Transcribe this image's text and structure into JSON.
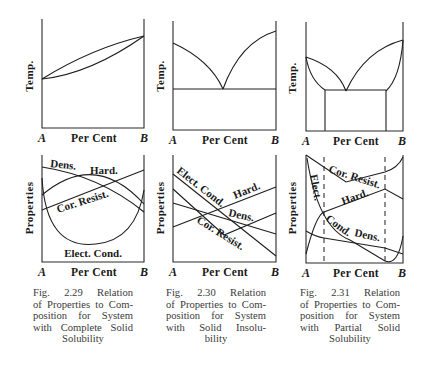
{
  "figures": [
    {
      "id": "2.29",
      "caption_lines": [
        "Fig. 2.29 Relation",
        "of Properties to Com-",
        "position for System",
        "with Complete Solid",
        "Solubility"
      ],
      "top_panel": {
        "ylabel": "Temp.",
        "xlabel": "Per Cent",
        "x_start": "A",
        "x_end": "B",
        "description": "Lens-shaped liquidus/solidus between melting points of A and B"
      },
      "bottom_panel": {
        "ylabel": "Properties",
        "xlabel": "Per Cent",
        "x_start": "A",
        "x_end": "B",
        "curve_labels": [
          "Dens.",
          "Hard.",
          "Cor. Resist.",
          "Elect. Cond."
        ]
      }
    },
    {
      "id": "2.30",
      "caption_lines": [
        "Fig. 2.30 Relation",
        "of Properties to Com-",
        "position for System",
        "with Solid Insolu-",
        "bility"
      ],
      "top_panel": {
        "ylabel": "Temp.",
        "xlabel": "Per Cent",
        "x_start": "A",
        "x_end": "B",
        "description": "Simple eutectic with horizontal eutectic line"
      },
      "bottom_panel": {
        "ylabel": "Properties",
        "xlabel": "Per Cent",
        "x_start": "A",
        "x_end": "B",
        "curve_labels": [
          "Elect. Cond.",
          "Hard.",
          "Dens.",
          "Cor. Resist."
        ]
      }
    },
    {
      "id": "2.31",
      "caption_lines": [
        "Fig. 2.31 Relation",
        "of Properties to Com-",
        "position for System",
        "with Partial Solid",
        "Solubility"
      ],
      "top_panel": {
        "ylabel": "Temp.",
        "xlabel": "Per Cent",
        "x_start": "A",
        "x_end": "B",
        "description": "Eutectic with terminal solid solutions and solvus lines"
      },
      "bottom_panel": {
        "ylabel": "Properties",
        "xlabel": "Per Cent",
        "x_start": "A",
        "x_end": "B",
        "curve_labels": [
          "Cor. Resist.",
          "Elect.",
          "Hard.",
          "Cond.",
          "Dens."
        ]
      }
    }
  ]
}
